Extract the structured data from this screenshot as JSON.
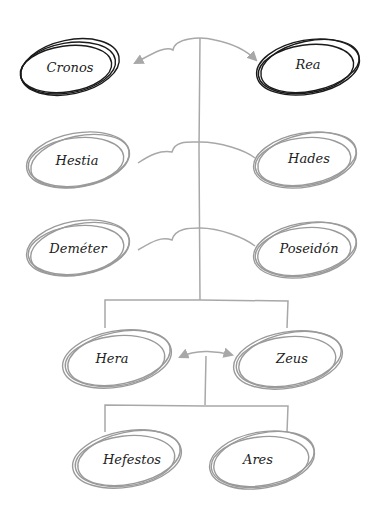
{
  "diagram": {
    "type": "family-tree",
    "colors": {
      "parents_outline": "#1a1a1a",
      "children_outline": "#9a9a9a",
      "connector": "#a8a8a8",
      "text": "#222222"
    },
    "nodes": {
      "cronos": {
        "label": "Cronos"
      },
      "rea": {
        "label": "Rea"
      },
      "hestia": {
        "label": "Hestia"
      },
      "hades": {
        "label": "Hades"
      },
      "demeter": {
        "label": "Deméter"
      },
      "poseidon": {
        "label": "Poseidón"
      },
      "hera": {
        "label": "Hera"
      },
      "zeus": {
        "label": "Zeus"
      },
      "hefestos": {
        "label": "Hefestos"
      },
      "ares": {
        "label": "Ares"
      }
    },
    "edges": [
      {
        "from": "Cronos",
        "to": "Rea",
        "type": "marriage-double-arrow"
      },
      {
        "from": "Hestia",
        "to": "Hades",
        "type": "sibling-link"
      },
      {
        "from": "Deméter",
        "to": "Poseidón",
        "type": "sibling-link"
      },
      {
        "from": "Hera",
        "to": "Zeus",
        "type": "marriage-double-arrow"
      },
      {
        "from": "Cronos+Rea",
        "to": [
          "Hera",
          "Zeus"
        ],
        "type": "descent-bracket"
      },
      {
        "from": "Hera+Zeus",
        "to": [
          "Hefestos",
          "Ares"
        ],
        "type": "descent-bracket"
      }
    ]
  }
}
